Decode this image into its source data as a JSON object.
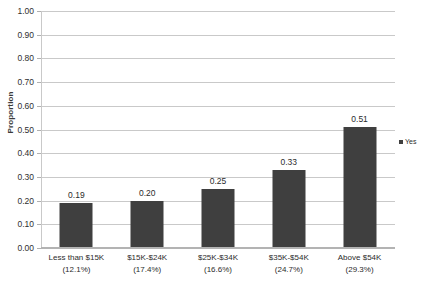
{
  "chart_data": {
    "type": "bar",
    "title": "",
    "xlabel": "",
    "ylabel": "Proportion",
    "ylim": [
      0,
      1.0
    ],
    "ytick_step": 0.1,
    "grid": "horizontal",
    "legend_position": "right",
    "categories": [
      "Less than $15K",
      "$15K-$24K",
      "$25K-$34K",
      "$35K-$54K",
      "Above $54K"
    ],
    "category_sublabels": [
      "(12.1%)",
      "(17.4%)",
      "(16.6%)",
      "(24.7%)",
      "(29.3%)"
    ],
    "values": [
      0.19,
      0.2,
      0.25,
      0.33,
      0.51
    ],
    "value_labels": [
      "0.19",
      "0.20",
      "0.25",
      "0.33",
      "0.51"
    ],
    "series": [
      {
        "name": "Yes",
        "values": [
          0.19,
          0.2,
          0.25,
          0.33,
          0.51
        ],
        "color": "#3f3f3f"
      }
    ],
    "ytick_labels": [
      "0.00",
      "0.10",
      "0.20",
      "0.30",
      "0.40",
      "0.50",
      "0.60",
      "0.70",
      "0.80",
      "0.90",
      "1.00"
    ],
    "ytick_values": [
      0,
      0.1,
      0.2,
      0.3,
      0.4,
      0.5,
      0.6,
      0.7,
      0.8,
      0.9,
      1.0
    ]
  },
  "legend": {
    "entries": [
      {
        "label": "Yes",
        "color": "#3f3f3f"
      }
    ]
  },
  "colors": {
    "bar": "#3f3f3f",
    "gridline": "#c9c9c9",
    "background": "#ffffff",
    "text": "#2b2b2b"
  }
}
